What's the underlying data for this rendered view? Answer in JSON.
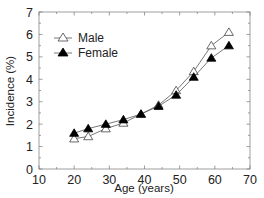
{
  "chart_data": {
    "type": "line",
    "title": "",
    "xlabel": "Age (years)",
    "ylabel": "Incidence (%)",
    "xlim": [
      10,
      70
    ],
    "ylim": [
      0,
      7
    ],
    "xticks": [
      10,
      20,
      30,
      40,
      50,
      60,
      70
    ],
    "yticks": [
      0,
      1,
      2,
      3,
      4,
      5,
      6,
      7
    ],
    "x_tick_labels": [
      "10",
      "20",
      "30",
      "40",
      "50",
      "60",
      "70"
    ],
    "y_tick_labels": [
      "0",
      "1",
      "2",
      "3",
      "4",
      "5",
      "6",
      "7"
    ],
    "grid": false,
    "legend_position": "upper left",
    "x": [
      20,
      24,
      29,
      34,
      39,
      44,
      49,
      54,
      59,
      64
    ],
    "series": [
      {
        "name": "Male",
        "marker": "open-triangle",
        "color": "#333333",
        "values": [
          1.35,
          1.45,
          1.8,
          2.05,
          2.45,
          2.85,
          3.5,
          4.35,
          5.5,
          6.1
        ]
      },
      {
        "name": "Female",
        "marker": "filled-triangle",
        "color": "#000000",
        "values": [
          1.6,
          1.8,
          2.0,
          2.2,
          2.45,
          2.8,
          3.3,
          4.1,
          4.95,
          5.5
        ]
      }
    ]
  },
  "legend": {
    "items": [
      {
        "label": "Male"
      },
      {
        "label": "Female"
      }
    ]
  },
  "axes": {
    "xlabel": "Age (years)",
    "ylabel": "Incidence (%)"
  }
}
